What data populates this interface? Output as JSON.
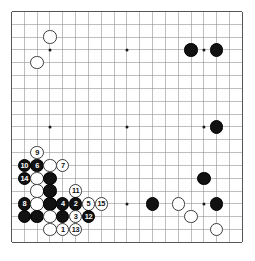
{
  "board": {
    "name": "go-board",
    "size": 19,
    "line_color": "#8a8a8a",
    "border_color": "#555555",
    "background_color": "#ffffff",
    "black_color": "#111111",
    "white_color": "#ffffff",
    "origin_x": 11.5,
    "origin_y": 11.5,
    "spacing": 12.83,
    "star_points": [
      {
        "col": 3,
        "row": 3
      },
      {
        "col": 9,
        "row": 3
      },
      {
        "col": 15,
        "row": 3
      },
      {
        "col": 3,
        "row": 9
      },
      {
        "col": 9,
        "row": 9
      },
      {
        "col": 15,
        "row": 9
      },
      {
        "col": 3,
        "row": 15
      },
      {
        "col": 9,
        "row": 15
      },
      {
        "col": 15,
        "row": 15
      }
    ],
    "stones": [
      {
        "col": 3,
        "row": 2,
        "color": "white",
        "label": ""
      },
      {
        "col": 2,
        "row": 4,
        "color": "white",
        "label": ""
      },
      {
        "col": 14,
        "row": 3,
        "color": "black",
        "label": ""
      },
      {
        "col": 16,
        "row": 3,
        "color": "black",
        "label": ""
      },
      {
        "col": 16,
        "row": 9,
        "color": "black",
        "label": ""
      },
      {
        "col": 15,
        "row": 13,
        "color": "black",
        "label": ""
      },
      {
        "col": 11,
        "row": 15,
        "color": "black",
        "label": ""
      },
      {
        "col": 13,
        "row": 15,
        "color": "white",
        "label": ""
      },
      {
        "col": 16,
        "row": 15,
        "color": "black",
        "label": ""
      },
      {
        "col": 14,
        "row": 16,
        "color": "white",
        "label": ""
      },
      {
        "col": 16,
        "row": 17,
        "color": "white",
        "label": ""
      },
      {
        "col": 2,
        "row": 11,
        "color": "white",
        "label": "9"
      },
      {
        "col": 1,
        "row": 12,
        "color": "black",
        "label": "10"
      },
      {
        "col": 2,
        "row": 12,
        "color": "black",
        "label": "6"
      },
      {
        "col": 3,
        "row": 12,
        "color": "white",
        "label": ""
      },
      {
        "col": 4,
        "row": 12,
        "color": "white",
        "label": "7"
      },
      {
        "col": 1,
        "row": 13,
        "color": "black",
        "label": "14"
      },
      {
        "col": 2,
        "row": 13,
        "color": "white",
        "label": ""
      },
      {
        "col": 3,
        "row": 13,
        "color": "black",
        "label": ""
      },
      {
        "col": 2,
        "row": 14,
        "color": "white",
        "label": ""
      },
      {
        "col": 3,
        "row": 14,
        "color": "black",
        "label": ""
      },
      {
        "col": 5,
        "row": 14,
        "color": "white",
        "label": "11"
      },
      {
        "col": 1,
        "row": 15,
        "color": "black",
        "label": "8"
      },
      {
        "col": 2,
        "row": 15,
        "color": "white",
        "label": ""
      },
      {
        "col": 3,
        "row": 15,
        "color": "black",
        "label": ""
      },
      {
        "col": 4,
        "row": 15,
        "color": "black",
        "label": "4"
      },
      {
        "col": 5,
        "row": 15,
        "color": "black",
        "label": "2"
      },
      {
        "col": 6,
        "row": 15,
        "color": "white",
        "label": "5"
      },
      {
        "col": 7,
        "row": 15,
        "color": "white",
        "label": "15"
      },
      {
        "col": 1,
        "row": 16,
        "color": "black",
        "label": ""
      },
      {
        "col": 2,
        "row": 16,
        "color": "black",
        "label": ""
      },
      {
        "col": 3,
        "row": 16,
        "color": "white",
        "label": ""
      },
      {
        "col": 4,
        "row": 16,
        "color": "black",
        "label": ""
      },
      {
        "col": 5,
        "row": 16,
        "color": "white",
        "label": "3"
      },
      {
        "col": 6,
        "row": 16,
        "color": "black",
        "label": "12"
      },
      {
        "col": 3,
        "row": 17,
        "color": "white",
        "label": ""
      },
      {
        "col": 4,
        "row": 17,
        "color": "white",
        "label": "1"
      },
      {
        "col": 5,
        "row": 17,
        "color": "white",
        "label": "13"
      }
    ]
  }
}
